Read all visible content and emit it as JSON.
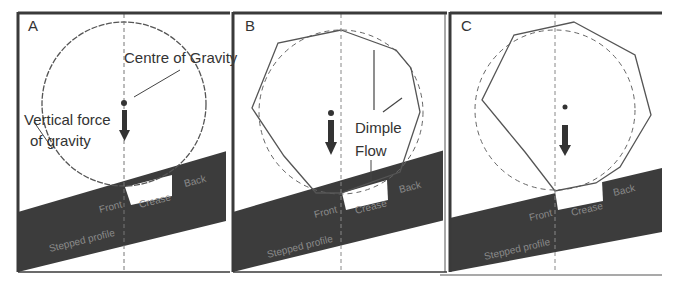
{
  "panels": [
    {
      "id": "A",
      "label": "A",
      "shape": "circle",
      "annotations": {
        "centre_of_gravity": "Centre of Gravity",
        "vertical_force_line1": "Vertical force",
        "vertical_force_line2": "of gravity"
      },
      "slope_labels": {
        "front": "Front",
        "back": "Back",
        "crease": "Crease",
        "lower": "Stepped profile"
      }
    },
    {
      "id": "B",
      "label": "B",
      "shape": "polygon-unstable",
      "annotations": {
        "dimple_flow_line1": "Dimple",
        "dimple_flow_line2": "Flow"
      },
      "slope_labels": {
        "front": "Front",
        "back": "Back",
        "crease": "Crease",
        "lower": "Stepped profile"
      }
    },
    {
      "id": "C",
      "label": "C",
      "shape": "polygon-settled",
      "annotations": {},
      "slope_labels": {
        "front": "Front",
        "back": "Back",
        "crease": "Crease",
        "lower": "Stepped profile"
      }
    }
  ],
  "colors": {
    "frame": "#3a3a3a",
    "slope": "#3c3c3c",
    "outline": "#555555",
    "text": "#333333",
    "slope_text": "#8a8a8a"
  }
}
